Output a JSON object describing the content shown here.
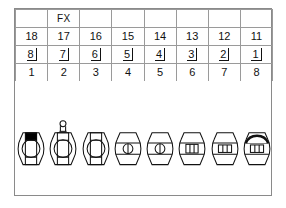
{
  "chart": {
    "border_color": "#8a8a8a",
    "grid_color": "#9a9a9a",
    "ink_color": "#111111",
    "filled_color": "#000000",
    "background": "#ffffff"
  },
  "table": {
    "columns": 8,
    "rows": [
      {
        "name": "annotation-row",
        "cells": [
          "",
          "FX",
          "",
          "",
          "",
          "",
          "",
          ""
        ]
      },
      {
        "name": "fdi-row",
        "cells": [
          "18",
          "17",
          "16",
          "15",
          "14",
          "13",
          "12",
          "11"
        ]
      },
      {
        "name": "palmer-row",
        "cells": [
          "8",
          "7",
          "6",
          "5",
          "4",
          "3",
          "2",
          "1"
        ]
      },
      {
        "name": "universal-row",
        "cells": [
          "1",
          "2",
          "3",
          "4",
          "5",
          "6",
          "7",
          "8"
        ]
      }
    ]
  },
  "teeth": [
    {
      "position": 1,
      "fdi": "18",
      "palmer": "8",
      "universal": "1",
      "type": "molar",
      "marking": "filled-surface",
      "marking_color": "#000000",
      "crown": false
    },
    {
      "position": 2,
      "fdi": "17",
      "palmer": "7",
      "universal": "2",
      "type": "molar",
      "marking": "crown-post",
      "marking_color": "#111111",
      "crown": true
    },
    {
      "position": 3,
      "fdi": "16",
      "palmer": "6",
      "universal": "3",
      "type": "molar",
      "marking": "none",
      "marking_color": "#111111",
      "crown": false
    },
    {
      "position": 4,
      "fdi": "15",
      "palmer": "5",
      "universal": "4",
      "type": "premolar",
      "marking": "none",
      "marking_color": "#111111",
      "crown": false
    },
    {
      "position": 5,
      "fdi": "14",
      "palmer": "4",
      "universal": "5",
      "type": "premolar",
      "marking": "none",
      "marking_color": "#111111",
      "crown": false
    },
    {
      "position": 6,
      "fdi": "13",
      "palmer": "3",
      "universal": "6",
      "type": "canine",
      "marking": "none",
      "marking_color": "#111111",
      "crown": false
    },
    {
      "position": 7,
      "fdi": "12",
      "palmer": "2",
      "universal": "7",
      "type": "incisor",
      "marking": "none",
      "marking_color": "#111111",
      "crown": false
    },
    {
      "position": 8,
      "fdi": "11",
      "palmer": "1",
      "universal": "8",
      "type": "incisor",
      "marking": "bold-arc",
      "marking_color": "#111111",
      "crown": false
    }
  ]
}
